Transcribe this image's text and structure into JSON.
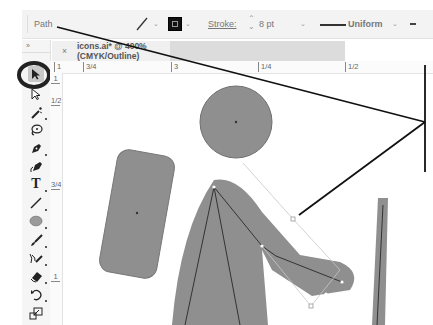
{
  "control_bar": {
    "selection_type": "Path",
    "stroke_label": "Stroke:",
    "stroke_weight": "8 pt",
    "variable_width_profile": "Uniform",
    "fill_icon": "stroke-path-icon",
    "stroke_swatch_color": "#111111"
  },
  "document_tab": {
    "close_glyph": "×",
    "title": "icons.ai* @ 400% (CMYK/Outline)"
  },
  "toolbar": {
    "collapse_glyph": "»",
    "tools": [
      {
        "name": "selection-tool",
        "icon": "arrow-pointer-icon",
        "selected": true
      },
      {
        "name": "direct-selection-tool",
        "icon": "hollow-arrow-icon"
      },
      {
        "name": "magic-wand-tool",
        "icon": "magic-wand-icon"
      },
      {
        "name": "lasso-tool",
        "icon": "lasso-icon"
      },
      {
        "name": "pen-tool",
        "icon": "pen-icon"
      },
      {
        "name": "curvature-tool",
        "icon": "curvature-pen-icon"
      },
      {
        "name": "type-tool",
        "icon": "type-icon",
        "glyph": "T"
      },
      {
        "name": "line-segment-tool",
        "icon": "line-icon"
      },
      {
        "name": "ellipse-tool",
        "icon": "ellipse-icon"
      },
      {
        "name": "paintbrush-tool",
        "icon": "paintbrush-icon"
      },
      {
        "name": "shaper-tool",
        "icon": "shaper-icon"
      },
      {
        "name": "eraser-tool",
        "icon": "eraser-icon"
      },
      {
        "name": "rotate-tool",
        "icon": "rotate-icon"
      },
      {
        "name": "scale-tool",
        "icon": "scale-icon"
      }
    ]
  },
  "rulers": {
    "horizontal": [
      {
        "label": "1",
        "x": 4
      },
      {
        "label": "3/4",
        "x": 33
      },
      {
        "label": "3",
        "x": 121
      },
      {
        "label": "1/4",
        "x": 208
      },
      {
        "label": "1/2",
        "x": 295
      }
    ],
    "vertical": [
      {
        "label": "1",
        "y": 2
      },
      {
        "label": "1/2",
        "y": 24
      },
      {
        "label": "3/4",
        "y": 108
      },
      {
        "label": "1",
        "y": 200
      }
    ]
  },
  "canvas": {
    "artwork": "hiker-icon",
    "fill_color": "#8f8f8f",
    "path_color": "#333333",
    "annotation_color": "#111111"
  }
}
